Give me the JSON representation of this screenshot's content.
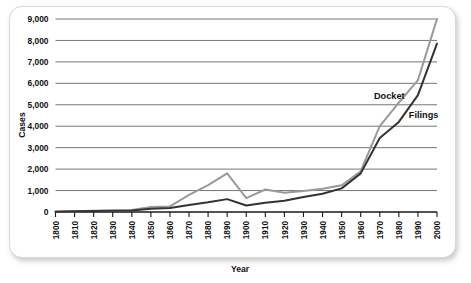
{
  "chart_data": {
    "type": "line",
    "title": "",
    "xlabel": "Year",
    "ylabel": "Cases",
    "xlim": [
      1800,
      2000
    ],
    "ylim": [
      0,
      9000
    ],
    "grid": true,
    "legend_position": "inline-annotation",
    "x": [
      1800,
      1810,
      1820,
      1830,
      1840,
      1850,
      1860,
      1870,
      1880,
      1890,
      1900,
      1910,
      1920,
      1930,
      1940,
      1950,
      1960,
      1970,
      1980,
      1990,
      2000
    ],
    "categories": [
      "1800",
      "1810",
      "1820",
      "1830",
      "1840",
      "1850",
      "1860",
      "1870",
      "1880",
      "1890",
      "1900",
      "1910",
      "1920",
      "1930",
      "1940",
      "1950",
      "1960",
      "1970",
      "1980",
      "1990",
      "2000"
    ],
    "ytick_labels": [
      "0",
      "1,000",
      "2,000",
      "3,000",
      "4,000",
      "5,000",
      "6,000",
      "7,000",
      "8,000",
      "9,000"
    ],
    "ytick_values": [
      0,
      1000,
      2000,
      3000,
      4000,
      5000,
      6000,
      7000,
      8000,
      9000
    ],
    "series": [
      {
        "name": "Docket",
        "color": "#9a9a9a",
        "values": [
          20,
          40,
          60,
          70,
          90,
          230,
          260,
          800,
          1250,
          1800,
          650,
          1050,
          900,
          980,
          1080,
          1250,
          1900,
          4000,
          5100,
          6150,
          9000
        ],
        "annotation": {
          "label": "Docket",
          "x": 1975,
          "y": 5250
        }
      },
      {
        "name": "Filings",
        "color": "#333333",
        "values": [
          15,
          30,
          45,
          55,
          70,
          150,
          190,
          330,
          450,
          600,
          300,
          430,
          520,
          700,
          850,
          1100,
          1800,
          3450,
          4200,
          5450,
          7850
        ],
        "annotation": {
          "label": "Filings",
          "x": 1993,
          "y": 4400
        }
      }
    ]
  }
}
